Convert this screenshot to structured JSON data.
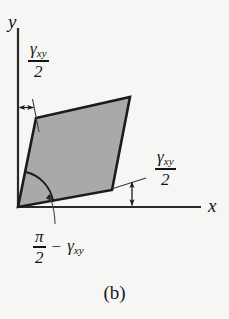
{
  "figure": {
    "caption": "(b)",
    "axes": {
      "y_label": "y",
      "x_label": "x"
    },
    "labels": {
      "shear_half_top": {
        "numerator_symbol": "γ",
        "numerator_subscript": "xy",
        "denominator": "2"
      },
      "shear_half_right": {
        "numerator_symbol": "γ",
        "numerator_subscript": "xy",
        "denominator": "2"
      },
      "angle_bottom": {
        "numerator": "π",
        "denominator": "2",
        "operator": "−",
        "term_symbol": "γ",
        "term_subscript": "xy"
      }
    },
    "colors": {
      "background": "#f6f6f4",
      "shape_fill": "#a9a9a9",
      "shape_stroke": "#1b1b1b",
      "axis": "#2a2a2a",
      "text": "#141414"
    },
    "geometry": {
      "origin": [
        18,
        207
      ],
      "parallelogram_vertices": [
        [
          18,
          207
        ],
        [
          36,
          118
        ],
        [
          130,
          97
        ],
        [
          112,
          190
        ]
      ],
      "x_axis_end": [
        201,
        207
      ],
      "y_axis_top": [
        18,
        28
      ]
    }
  }
}
